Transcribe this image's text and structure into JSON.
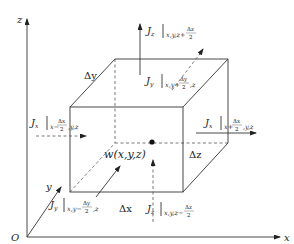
{
  "diagram": {
    "type": "control-volume-flux-diagram",
    "axes": {
      "origin": "O",
      "x_label": "x",
      "y_label": "y",
      "z_label": "z"
    },
    "center_point": {
      "label_name": "w",
      "label_args": "(x,y,z)"
    },
    "dimensions": {
      "dx": "Δx",
      "dy": "Δy",
      "dz": "Δz"
    },
    "fluxes": [
      {
        "id": "jz-top",
        "symbol": "J",
        "sub": "z",
        "eval": "x,y,z+",
        "frac_num": "Δz",
        "frac_den": "2",
        "direction": "up"
      },
      {
        "id": "jy-back",
        "symbol": "J",
        "sub": "y",
        "eval_pre": "x,y+",
        "frac_num": "Δy",
        "frac_den": "2",
        "eval_post": ",z",
        "direction": "back"
      },
      {
        "id": "jx-left",
        "symbol": "J",
        "sub": "x",
        "eval_pre": "x−",
        "frac_num": "Δx",
        "frac_den": "2",
        "eval_post": ",y,z",
        "direction": "right"
      },
      {
        "id": "jx-right",
        "symbol": "J",
        "sub": "x",
        "eval_pre": "x+",
        "frac_num": "Δx",
        "frac_den": "2",
        "eval_post": ",y,z",
        "direction": "right"
      },
      {
        "id": "jy-front",
        "symbol": "J",
        "sub": "y",
        "eval_pre": "x,y−",
        "frac_num": "Δy",
        "frac_den": "2",
        "eval_post": ",z",
        "direction": "back"
      },
      {
        "id": "jz-bottom",
        "symbol": "J",
        "sub": "z",
        "eval": "x,y,z−",
        "frac_num": "Δz",
        "frac_den": "2",
        "direction": "up"
      }
    ]
  }
}
